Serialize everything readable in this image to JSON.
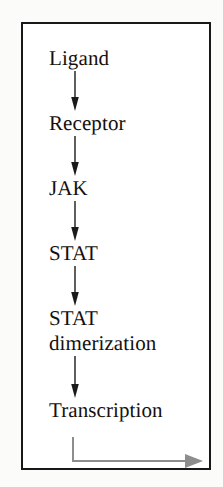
{
  "figure": {
    "frame_color": "#181818",
    "background_color": "#ffffff",
    "text_color": "#15100e",
    "arrow_color": "#1a1a1a",
    "output_arrow_color": "#8d8d8d"
  },
  "diagram_data": {
    "type": "flowchart",
    "orientation": "vertical",
    "nodes": [
      {
        "id": "ligand",
        "label": "Ligand"
      },
      {
        "id": "receptor",
        "label": "Receptor"
      },
      {
        "id": "jak",
        "label": "JAK"
      },
      {
        "id": "stat",
        "label": "STAT"
      },
      {
        "id": "stat-dimerization",
        "label": "STAT\ndimerization"
      },
      {
        "id": "transcription",
        "label": "Transcription"
      }
    ],
    "edges": [
      {
        "from": "ligand",
        "to": "receptor",
        "style": "solid-black-arrow"
      },
      {
        "from": "receptor",
        "to": "jak",
        "style": "solid-black-arrow"
      },
      {
        "from": "jak",
        "to": "stat",
        "style": "solid-black-arrow"
      },
      {
        "from": "stat",
        "to": "stat-dimerization",
        "style": "solid-black-arrow"
      },
      {
        "from": "stat-dimerization",
        "to": "transcription",
        "style": "solid-black-arrow"
      },
      {
        "from": "transcription",
        "to": "",
        "style": "gray-elbow-arrow-right"
      }
    ]
  },
  "steps": [
    {
      "label": "Ligand"
    },
    {
      "label": "Receptor"
    },
    {
      "label": "JAK"
    },
    {
      "label": "STAT"
    },
    {
      "label": "STAT\ndimerization"
    },
    {
      "label": "Transcription"
    }
  ]
}
